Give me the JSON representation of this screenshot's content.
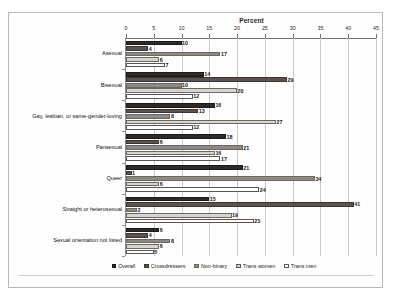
{
  "chart_data": {
    "type": "bar",
    "orientation": "horizontal",
    "title": "Percent",
    "xlabel": "Percent",
    "ylabel": "",
    "xlim": [
      0,
      45
    ],
    "xticks": [
      0,
      5,
      10,
      15,
      20,
      25,
      30,
      35,
      40,
      45
    ],
    "grid": true,
    "legend_position": "bottom",
    "categories": [
      "Asexual",
      "Bisexual",
      "Gay, lesbian, or same-gender-loving",
      "Pansexual",
      "Queer",
      "Straight or heterosexual",
      "Sexual orientation not listed"
    ],
    "series": [
      {
        "name": "Overall",
        "color": "#2e2a28",
        "values": [
          10,
          14,
          16,
          18,
          21,
          15,
          6
        ]
      },
      {
        "name": "Crossdressers",
        "color": "#5a534f",
        "values": [
          4,
          29,
          13,
          6,
          1,
          41,
          4
        ]
      },
      {
        "name": "Non-binary",
        "color": "#8d8984",
        "values": [
          17,
          10,
          8,
          21,
          34,
          2,
          8
        ]
      },
      {
        "name": "Trans women",
        "color": "#d8d5cf",
        "values": [
          6,
          20,
          27,
          16,
          6,
          19,
          6
        ]
      },
      {
        "name": "Trans men",
        "color": "#ffffff",
        "values": [
          7,
          12,
          12,
          17,
          24,
          23,
          5
        ]
      }
    ]
  }
}
